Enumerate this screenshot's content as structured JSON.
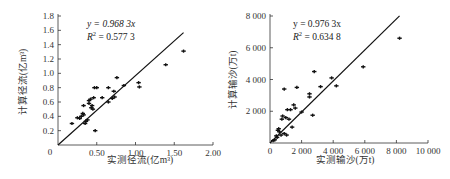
{
  "chart_data": [
    {
      "type": "scatter",
      "title": "",
      "xlabel": "实测径流(亿m³)",
      "ylabel": "计算径流(亿m³)",
      "xlim": [
        0,
        2.0
      ],
      "ylim": [
        0,
        1.8
      ],
      "x_ticks": [
        "0",
        "0.50",
        "1.00",
        "1.50",
        "2.00"
      ],
      "y_ticks": [
        "0.2",
        "0.4",
        "0.6",
        "0.8",
        "1.0",
        "1.2",
        "1.4",
        "1.6",
        "1.8"
      ],
      "origin_label": "0",
      "grid": false,
      "fit_line": {
        "slope": 0.9683,
        "intercept": 0,
        "x_end": 1.62
      },
      "annotation": {
        "equation": "y = 0.968 3x",
        "r2_prefix": "R",
        "r2_sup": "2",
        "r2_value": " = 0.577 3"
      },
      "points": [
        [
          0.18,
          0.3
        ],
        [
          0.25,
          0.38
        ],
        [
          0.28,
          0.37
        ],
        [
          0.3,
          0.4
        ],
        [
          0.32,
          0.44
        ],
        [
          0.33,
          0.42
        ],
        [
          0.33,
          0.55
        ],
        [
          0.35,
          0.3
        ],
        [
          0.36,
          0.33
        ],
        [
          0.38,
          0.35
        ],
        [
          0.4,
          0.58
        ],
        [
          0.4,
          0.62
        ],
        [
          0.42,
          0.64
        ],
        [
          0.43,
          0.52
        ],
        [
          0.44,
          0.55
        ],
        [
          0.45,
          0.5
        ],
        [
          0.46,
          0.66
        ],
        [
          0.47,
          0.8
        ],
        [
          0.48,
          0.2
        ],
        [
          0.5,
          0.8
        ],
        [
          0.57,
          0.66
        ],
        [
          0.65,
          0.8
        ],
        [
          0.65,
          0.6
        ],
        [
          0.7,
          0.65
        ],
        [
          0.72,
          0.75
        ],
        [
          0.73,
          0.67
        ],
        [
          0.76,
          0.94
        ],
        [
          0.85,
          0.83
        ],
        [
          1.04,
          0.87
        ],
        [
          1.05,
          0.81
        ],
        [
          1.39,
          1.12
        ],
        [
          1.62,
          1.31
        ]
      ]
    },
    {
      "type": "scatter",
      "title": "",
      "xlabel": "实测输沙(万t)",
      "ylabel": "计算输沙(万t)",
      "xlim": [
        0,
        10000
      ],
      "ylim": [
        0,
        8000
      ],
      "x_ticks": [
        "0",
        "2 000",
        "4 000",
        "6 000",
        "8 000",
        "10 000"
      ],
      "y_ticks": [
        "2 000",
        "4 000",
        "6 000",
        "8 000"
      ],
      "grid": false,
      "fit_line": {
        "slope": 0.9763,
        "intercept": 0,
        "x_end": 8200
      },
      "annotation": {
        "equation": "y = 0.976 3x",
        "r2_prefix": "R",
        "r2_sup": "2",
        "r2_value": " = 0.634 8"
      },
      "points": [
        [
          200,
          150
        ],
        [
          300,
          200
        ],
        [
          400,
          450
        ],
        [
          450,
          350
        ],
        [
          500,
          800
        ],
        [
          550,
          900
        ],
        [
          600,
          700
        ],
        [
          700,
          500
        ],
        [
          750,
          1500
        ],
        [
          800,
          1700
        ],
        [
          900,
          3400
        ],
        [
          900,
          600
        ],
        [
          1000,
          1600
        ],
        [
          1050,
          500
        ],
        [
          1100,
          2100
        ],
        [
          1200,
          1500
        ],
        [
          1300,
          2100
        ],
        [
          1400,
          1000
        ],
        [
          1500,
          2400
        ],
        [
          1600,
          2200
        ],
        [
          1700,
          3500
        ],
        [
          2000,
          1950
        ],
        [
          2500,
          3100
        ],
        [
          2500,
          2900
        ],
        [
          2700,
          1750
        ],
        [
          2800,
          4500
        ],
        [
          3200,
          3550
        ],
        [
          3900,
          4100
        ],
        [
          4200,
          3600
        ],
        [
          5900,
          4800
        ],
        [
          8200,
          6600
        ]
      ]
    }
  ]
}
